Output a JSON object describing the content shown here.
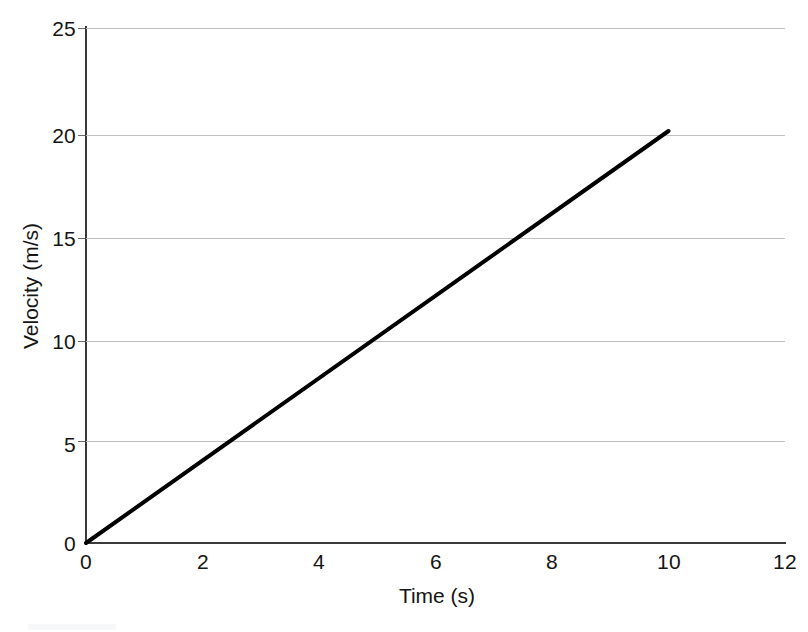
{
  "chart_data": {
    "type": "line",
    "title": "",
    "subtitle": "",
    "xlabel": "Time (s)",
    "ylabel": "Velocity (m/s)",
    "xlim": [
      0,
      12
    ],
    "ylim": [
      0,
      25
    ],
    "xticks": [
      0,
      2,
      4,
      6,
      8,
      10,
      12
    ],
    "yticks": [
      0,
      5,
      10,
      15,
      20,
      25
    ],
    "xtick_labels": [
      "0",
      "2",
      "4",
      "6",
      "8",
      "10",
      "12"
    ],
    "ytick_labels": [
      "0",
      "5",
      "10",
      "15",
      "20",
      "25"
    ],
    "grid": "horizontal",
    "grid_color": "#bfbfbf",
    "legend": "none",
    "annotations": [],
    "series": [
      {
        "name": "velocity",
        "color": "#000000",
        "line_width": 4,
        "markers": "none",
        "x": [
          0,
          10
        ],
        "values": [
          0,
          20
        ],
        "points": [
          {
            "x": 0,
            "y": 0
          },
          {
            "x": 2.5,
            "y": 5
          },
          {
            "x": 5,
            "y": 10
          },
          {
            "x": 7.5,
            "y": 15
          },
          {
            "x": 10,
            "y": 20
          }
        ],
        "slope": 2,
        "slope_units": "m/s^2"
      }
    ]
  },
  "figure": {
    "background": "#ffffff",
    "axis_color": "#3a3a3a"
  }
}
